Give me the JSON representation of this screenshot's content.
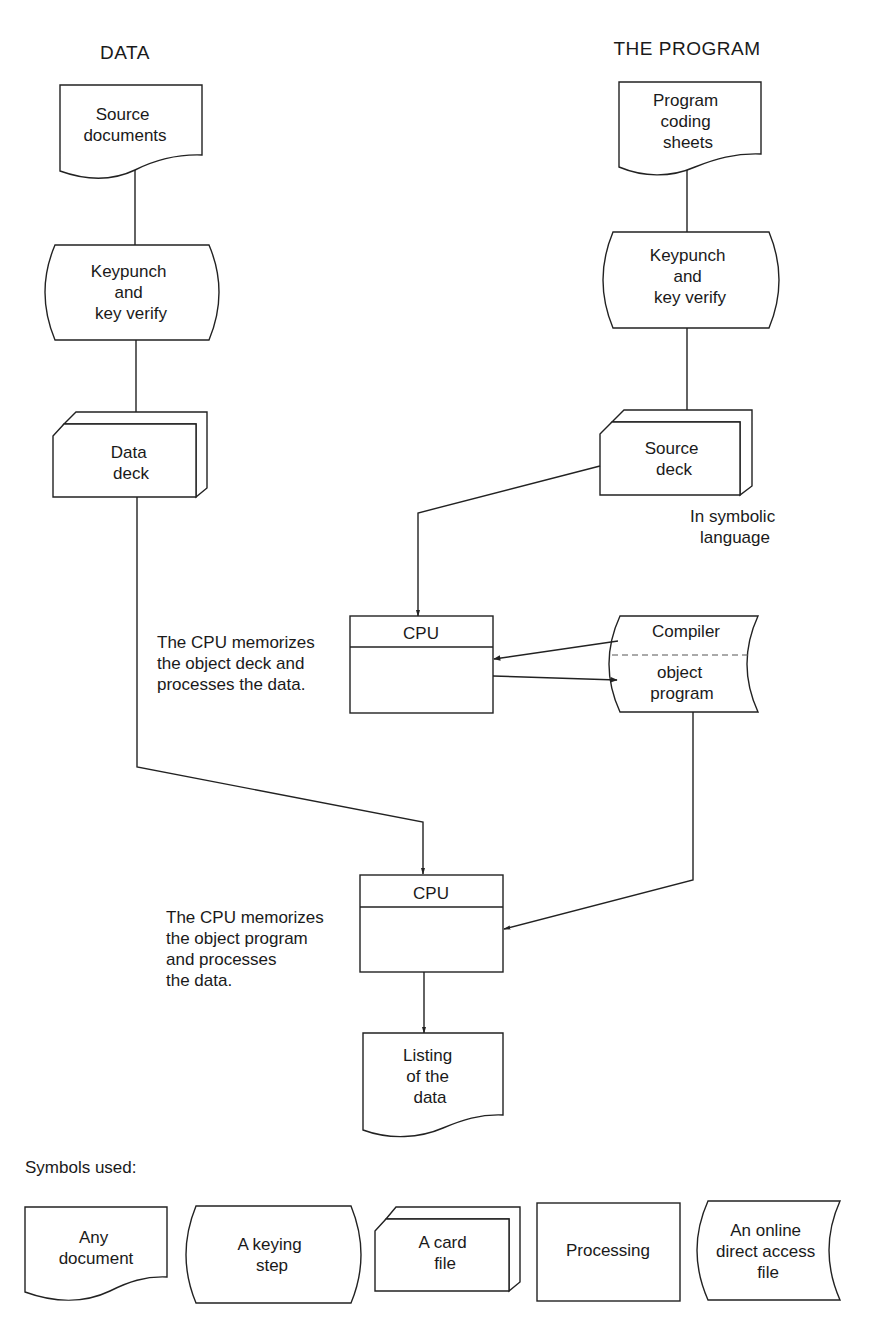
{
  "headers": {
    "data": "DATA",
    "program": "THE PROGRAM"
  },
  "data_column": {
    "source_documents": [
      "Source",
      "documents"
    ],
    "keypunch": [
      "Keypunch",
      "and",
      "key verify"
    ],
    "data_deck": [
      "Data",
      "deck"
    ]
  },
  "program_column": {
    "coding_sheets": [
      "Program",
      "coding",
      "sheets"
    ],
    "keypunch": [
      "Keypunch",
      "and",
      "key verify"
    ],
    "source_deck": [
      "Source",
      "deck"
    ],
    "source_deck_note": [
      "In symbolic",
      "language"
    ]
  },
  "compile_step": {
    "cpu_label": "CPU",
    "note": [
      "The CPU memorizes",
      "the object deck and",
      "processes the data."
    ],
    "compiler_top": "Compiler",
    "compiler_bottom": [
      "object",
      "program"
    ]
  },
  "run_step": {
    "cpu_label": "CPU",
    "note": [
      "The CPU memorizes",
      "the object program",
      "and processes",
      "the data."
    ],
    "listing": [
      "Listing",
      "of the",
      "data"
    ]
  },
  "legend": {
    "title": "Symbols used:",
    "items": [
      {
        "shape": "document",
        "label": [
          "Any",
          "document"
        ]
      },
      {
        "shape": "keying",
        "label": [
          "A keying",
          "step"
        ]
      },
      {
        "shape": "card-file",
        "label": [
          "A card",
          "file"
        ]
      },
      {
        "shape": "processing",
        "label": [
          "Processing"
        ]
      },
      {
        "shape": "online-file",
        "label": [
          "An online",
          "direct access",
          "file"
        ]
      }
    ]
  }
}
